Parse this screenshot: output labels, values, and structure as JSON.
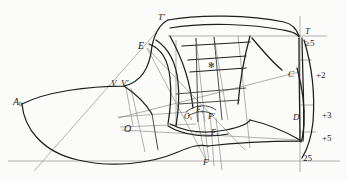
{
  "drawing": {
    "title": "Shoe last pattern construction drawing",
    "background_color": "#fbfbfa",
    "line_color": "#1f1f1f",
    "thin_line_color": "#8c8c8c",
    "width": 347,
    "height": 181
  },
  "labels": {
    "a0": "A",
    "a0_sub": "0",
    "v": "V",
    "v_prime": "V'",
    "o": "O",
    "o1": "O",
    "o1_sub": "1",
    "e": "E",
    "t_prime": "T'",
    "t": "T",
    "c": "C",
    "d": "D",
    "f": "F",
    "f_prime": "F'",
    "f1": "F",
    "f1_sub": "1",
    "f2": "F",
    "f2_sub": "2",
    "center_mark": "✻"
  },
  "dimensions": {
    "top_right": "≥5",
    "c_offset": "+2",
    "d_offset": "+3",
    "lower_offset": "+5",
    "heel_height": "25"
  }
}
